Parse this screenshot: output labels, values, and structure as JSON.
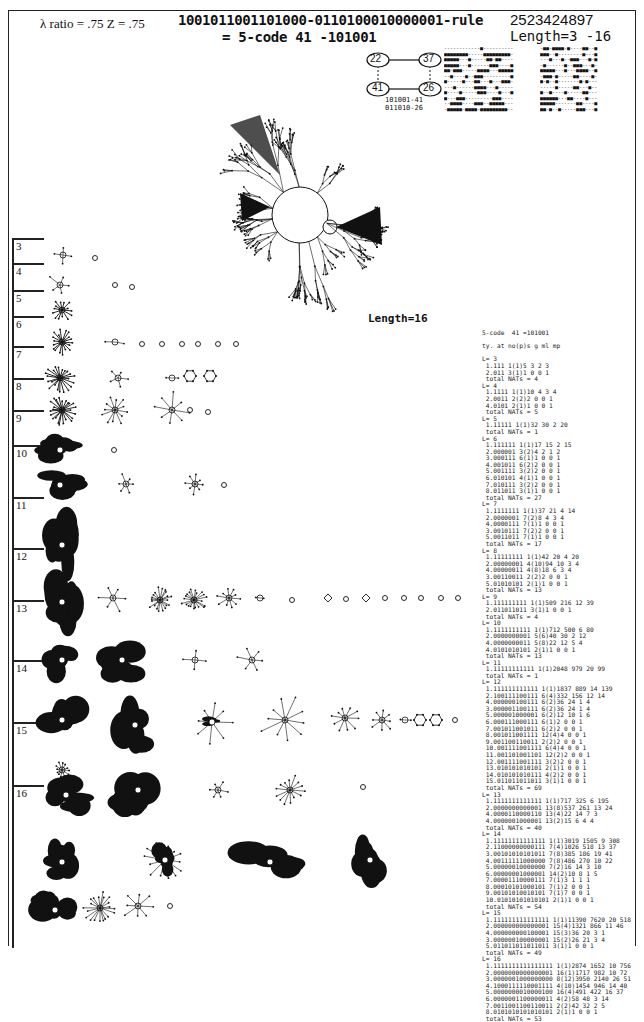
{
  "header": {
    "lambda_text": "λ ratio = .75   Z = .75",
    "rule_string": "1001011001101000-0110100010000001-rule",
    "rule_number": "2523424897",
    "code_line": "= 5-code  41 -101001",
    "length_range": "Length=3 -16"
  },
  "mini_network": {
    "nodes": [
      "22",
      "37",
      "41",
      "26"
    ],
    "caption_lines": [
      "101001-41",
      "011010-26"
    ]
  },
  "main_graph": {
    "label": "Length=16"
  },
  "row_labels": [
    "3",
    "4",
    "5",
    "6",
    "7",
    "8",
    "9",
    "10",
    "11",
    "12",
    "13",
    "14",
    "15",
    "16"
  ],
  "stats_table": {
    "title": "5-code  41 =101001",
    "columns_header": "ty. at no(p)s g ml mp",
    "blocks": [
      {
        "L": "L= 3",
        "rows": [
          "1.111 1(1)5 3 2 3",
          "2.011 3(1)1 0 0 1"
        ],
        "total": "total NATs = 4"
      },
      {
        "L": "L= 4",
        "rows": [
          "1.1111 1(1)10 4 3 4",
          "2.0011 2(2)2 0 0 1",
          "4.0101 2(1)1 0 0 1"
        ],
        "total": "total NATs = 5"
      },
      {
        "L": "L= 5",
        "rows": [
          "1.11111 1(1)32 30 2 20"
        ],
        "total": "total NATs = 1"
      },
      {
        "L": "L= 6",
        "rows": [
          "1.111111 1(1)17 15 2 15",
          "2.000001 3(2)4 2 1 2",
          "3.000111 6(1)1 0 0 1",
          "4.001011 6(2)2 0 0 1",
          "5.001111 3(2)2 0 0 1",
          "6.010101 4(1)1 0 0 1",
          "7.010111 3(2)2 0 0 1",
          "8.011011 3(1)1 0 0 1"
        ],
        "total": "total NATs = 27"
      },
      {
        "L": "L= 7",
        "rows": [
          "1.1111111 1(1)37 21 4 14",
          "2.0000001 7(2)8 4 3 4",
          "4.0000111 7(1)1 0 0 1",
          "3.0010111 7(2)2 0 0 1",
          "5.0011011 7(1)1 0 0 1"
        ],
        "total": "total NATs = 17"
      },
      {
        "L": "L= 8",
        "rows": [
          "1.11111111 1(1)42 20 4 20",
          "2.00000001 4(10)94 10 3 4",
          "4.00000011 4(8)18 6 3 4",
          "3.00110011 2(2)2 0 0 1",
          "5.01010101 2(1)1 0 0 1"
        ],
        "total": "total NATs = 13"
      },
      {
        "L": "L= 9",
        "rows": [
          "1.111111111 1(1)509 216 12 39",
          "2.011011011 3(1)1 0 0 1"
        ],
        "total": "total NATs = 4"
      },
      {
        "L": "L= 10",
        "rows": [
          "1.1111111111 1(1)712 500 6 80",
          "2.0000000001 5(6)40 30 2 12",
          "4.0000000011 5(8)22 12 5 4",
          "4.0101010101 2(1)1 0 0 1"
        ],
        "total": "total NATs = 13"
      },
      {
        "L": "L= 11",
        "rows": [
          "1.11111111111 1(1)2048 979 20 99"
        ],
        "total": "total NATs = 1"
      },
      {
        "L": "L= 12",
        "rows": [
          "1.111111111111 1(1)1837 889 14 139",
          "2.100111100111 6(4)332 156 12 14",
          "4.000000100111 6(2)36 24 1 4",
          "3.000001100111 6(2)36 24 1 4",
          "5.000001000001 6(2)12 10 1 6",
          "6.000111000111 6(1)2 0 0 1",
          "7.001011001011 6(2)2 0 0 1",
          "8.001011001111 12(4)4 0 0 1",
          "9.001100110011 2(2)2 0 0 1",
          "10.001111001111 6(4)4 0 0 1",
          "11.001101001101 12(2)2 0 0 1",
          "12.001111001111 3(2)2 0 0 1",
          "13.010101010101 2(1)1 0 0 1",
          "14.010101010111 4(2)2 0 0 1",
          "15.011011011011 3(1)1 0 0 1"
        ],
        "total": "total NATs = 69"
      },
      {
        "L": "L= 13",
        "rows": [
          "1.1111111111111 1(1)717 325 6 195",
          "2.0000000000001 13(8)537 261 13 24",
          "4.0000110000110 13(4)22 14 7 3",
          "4.0000001000001 13(2)15 6 4 4"
        ],
        "total": "total NATs = 40"
      },
      {
        "L": "L= 14",
        "rows": [
          "1.11111111111111 1(1)3019 1505 9 308",
          "2.11000000000111 7(4)1026 518 13 37",
          "3.00101010101011 7(8)385 186 19 41",
          "4.00111111000000 7(8)486 270 10 22",
          "5.00000010000000 7(2)16 14 3 10",
          "6.00000001000001 14(2)10 8 1 5",
          "7.00001110000111 7(1)3 1 1 1",
          "8.00010101000101 7(1)2 0 0 1",
          "9.00101010010101 7(1)7 0 0 1",
          "10.01010101010101 2(1)1 0 0 1"
        ],
        "total": "total NATs = 54"
      },
      {
        "L": "L= 15",
        "rows": [
          "1.111111111111111 1(1)11390 7620 20 518",
          "2.000000000000001 15(4)1321 866 11 46",
          "4.000000000100001 15(3)36 20 3 1",
          "3.000000100000001 15(2)26 21 3 4",
          "5.011011011011011 3(1)1 0 0 1"
        ],
        "total": "total NATs = 49"
      },
      {
        "L": "L= 16",
        "rows": [
          "1.1111111111111111 1(1)2874 1652 10 756",
          "2.0000000000000001 16(1)1717 982 10 72",
          "3.0000001000000000 8(12)3950 2140 26 51",
          "4.1000111110001111 4(10)1454 946 14 40",
          "5.0000000010000100 16(4)491 422 16 37",
          "6.0000001100000011 4(2)58 48 3 14",
          "7.0011001100110011 2(2)42 32 2 5",
          "8.0101010101010101 2(1)1 0 0 1"
        ],
        "total": "total NATs = 53"
      }
    ]
  },
  "ca_patterns": {
    "left": [
      "------------#----------",
      "########-----#########-",
      "#####---#-----##-##----",
      "#####---#------###----#",
      "##-###-----####---#####",
      "--#----#--###---------#",
      "#-----#---##---#---###-",
      "---#------####---#-----",
      "#----#-----###----#---#",
      "#---###---------###----",
      "--####----###--#####---",
      "-#####-####-#########--",
      "--###-----###---###----"
    ],
    "right": [
      "-##-####-#----##--#",
      "###--#--------#---#",
      "---#---#--###---#-#",
      "-#------#--###---#-",
      "#####---#---####--#",
      "-###-#-----##----#-",
      "#-#--#-------#-#---",
      "-----#-----##---#--",
      "#--#----#-----##---",
      "######---##----#---",
      "#####-------##----#",
      "##-#--#-----###---#",
      "######-----##----##"
    ]
  }
}
